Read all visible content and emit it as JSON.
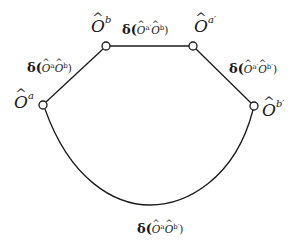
{
  "diagram": {
    "nodes": [
      {
        "id": "Oa",
        "symbol": "O",
        "superscript": "a"
      },
      {
        "id": "Ob",
        "symbol": "O",
        "superscript": "b"
      },
      {
        "id": "Oa_prime",
        "symbol": "O",
        "superscript": "a′"
      },
      {
        "id": "Ob_prime",
        "symbol": "O",
        "superscript": "b′"
      }
    ],
    "edges": [
      {
        "from": "Oa",
        "to": "Ob",
        "label": {
          "prefix": "δ(",
          "first": "O",
          "first_sup": "a",
          "second": "O",
          "second_sup": "b",
          "suffix": ")"
        }
      },
      {
        "from": "Ob",
        "to": "Oa_prime",
        "label": {
          "prefix": "δ(",
          "first": "O",
          "first_sup": "a′",
          "second": "O",
          "second_sup": "b",
          "suffix": ")"
        }
      },
      {
        "from": "Oa_prime",
        "to": "Ob_prime",
        "label": {
          "prefix": "δ(",
          "first": "O",
          "first_sup": "a′",
          "second": "O",
          "second_sup": "b′",
          "suffix": ")"
        }
      },
      {
        "from": "Oa",
        "to": "Ob_prime",
        "label": {
          "prefix": "δ(",
          "first": "O",
          "first_sup": "a",
          "second": "O",
          "second_sup": "b′",
          "suffix": ")"
        }
      }
    ],
    "colors": {
      "stroke": "#1a1a1a",
      "node_fill": "#ffffff",
      "background": "#ffffff"
    }
  }
}
